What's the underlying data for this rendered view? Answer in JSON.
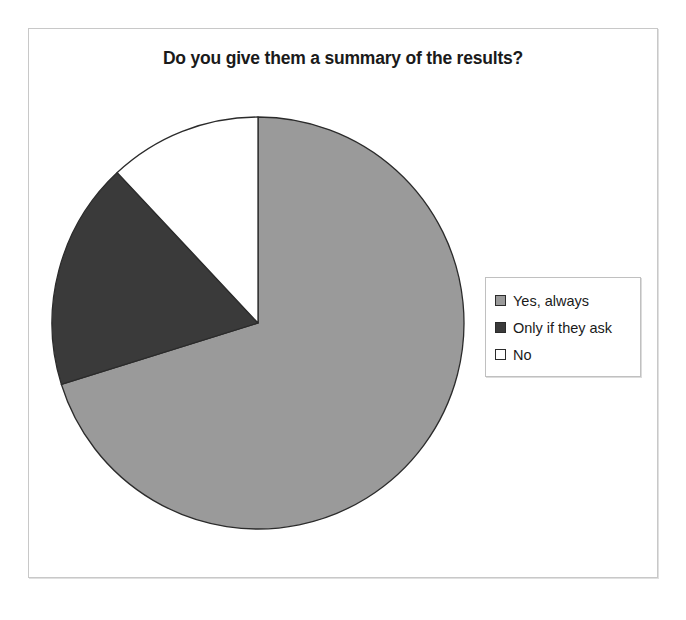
{
  "chart_data": {
    "type": "pie",
    "title": "Do you give them a summary of the results?",
    "categories": [
      "Yes, always",
      "Only if they ask",
      "No"
    ],
    "values": [
      70,
      18,
      12
    ],
    "unit": "percent",
    "colors": [
      "#9a9a9a",
      "#3a3a3a",
      "#ffffff"
    ],
    "start_angle_deg": 0,
    "direction": "clockwise",
    "legend_position": "right",
    "grid": false,
    "xlabel": "",
    "ylabel": "",
    "slices": [
      {
        "label": "Yes, always",
        "value": 70,
        "color": "#9a9a9a",
        "start_deg": 0,
        "end_deg": 252.7
      },
      {
        "label": "Only if they ask",
        "value": 18,
        "color": "#3a3a3a",
        "start_deg": 252.7,
        "end_deg": 316.9
      },
      {
        "label": "No",
        "value": 12,
        "color": "#ffffff",
        "start_deg": 316.9,
        "end_deg": 360
      }
    ]
  },
  "chart": {
    "title": "Do you give them a summary of the results?",
    "legend": {
      "items": [
        {
          "label": "Yes, always",
          "color": "#9a9a9a"
        },
        {
          "label": "Only if they ask",
          "color": "#3a3a3a"
        },
        {
          "label": "No",
          "color": "#ffffff"
        }
      ]
    }
  }
}
